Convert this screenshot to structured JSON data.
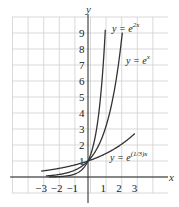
{
  "chart_data": {
    "type": "line",
    "title": "",
    "xlabel": "x",
    "ylabel": "y",
    "xlim": [
      -3.5,
      4.5
    ],
    "ylim": [
      -0.5,
      10
    ],
    "grid": true,
    "x_ticks": [
      "−3",
      "−2",
      "−1",
      "1",
      "2",
      "3"
    ],
    "y_ticks": [
      "1",
      "2",
      "3",
      "4",
      "5",
      "6",
      "7",
      "8",
      "9"
    ],
    "series": [
      {
        "name": "y = e^{2x}",
        "label_base": "y = e",
        "label_exp": "2x",
        "function": "exp(2x)",
        "x": [
          -2,
          -1,
          0,
          0.5,
          1,
          1.1
        ],
        "values": [
          0.02,
          0.14,
          1,
          2.72,
          7.39,
          9.03
        ]
      },
      {
        "name": "y = e^{x}",
        "label_base": "y = e",
        "label_exp": "x",
        "function": "exp(x)",
        "x": [
          -2,
          -1,
          0,
          1,
          2,
          2.2
        ],
        "values": [
          0.14,
          0.37,
          1,
          2.72,
          7.39,
          9.03
        ]
      },
      {
        "name": "y = e^{(1/3)x}",
        "label_base": "y = e",
        "label_exp": "(1/3)x",
        "function": "exp(x/3)",
        "x": [
          -3,
          -2,
          -1,
          0,
          1,
          2,
          3
        ],
        "values": [
          0.37,
          0.51,
          0.72,
          1,
          1.4,
          1.95,
          2.72
        ]
      }
    ],
    "legend": "inline labels next to curves"
  }
}
